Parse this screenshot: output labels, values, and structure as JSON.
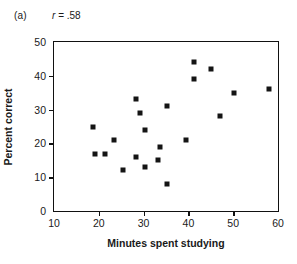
{
  "figure": {
    "panel_label": "(a)",
    "correlation_symbol": "r",
    "correlation_text": "= .58"
  },
  "chart_data": {
    "type": "scatter",
    "title": "",
    "subtitle": "",
    "xlabel": "Minutes spent studying",
    "ylabel": "Percent correct",
    "xlim": [
      10,
      60
    ],
    "ylim": [
      0,
      50
    ],
    "xticks": [
      10,
      20,
      30,
      40,
      50,
      60
    ],
    "yticks": [
      0,
      10,
      20,
      30,
      40,
      50
    ],
    "xticklabels": [
      "10",
      "20",
      "30",
      "40",
      "50",
      "60"
    ],
    "yticklabels": [
      "0",
      "10",
      "20",
      "30",
      "40",
      "50"
    ],
    "grid": false,
    "legend": null,
    "annotations": [
      {
        "text": "(a)",
        "position": "top-left"
      },
      {
        "text": "r = .58",
        "position": "top-left"
      }
    ],
    "marker": {
      "shape": "square",
      "color": "#141414",
      "size": 5
    },
    "series": [
      {
        "name": "students",
        "points": [
          {
            "x": 18.7,
            "y": 25
          },
          {
            "x": 19.2,
            "y": 17
          },
          {
            "x": 21.3,
            "y": 17
          },
          {
            "x": 23.5,
            "y": 21
          },
          {
            "x": 25.5,
            "y": 12
          },
          {
            "x": 28.2,
            "y": 33
          },
          {
            "x": 28.4,
            "y": 16
          },
          {
            "x": 29.3,
            "y": 29
          },
          {
            "x": 30.3,
            "y": 24
          },
          {
            "x": 30.4,
            "y": 13
          },
          {
            "x": 33.3,
            "y": 15
          },
          {
            "x": 33.7,
            "y": 19
          },
          {
            "x": 35.3,
            "y": 31
          },
          {
            "x": 35.3,
            "y": 8
          },
          {
            "x": 39.4,
            "y": 21
          },
          {
            "x": 41.2,
            "y": 44
          },
          {
            "x": 41.3,
            "y": 39
          },
          {
            "x": 45.0,
            "y": 42
          },
          {
            "x": 47.0,
            "y": 28
          },
          {
            "x": 50.2,
            "y": 35
          },
          {
            "x": 58.0,
            "y": 36
          }
        ]
      }
    ]
  }
}
